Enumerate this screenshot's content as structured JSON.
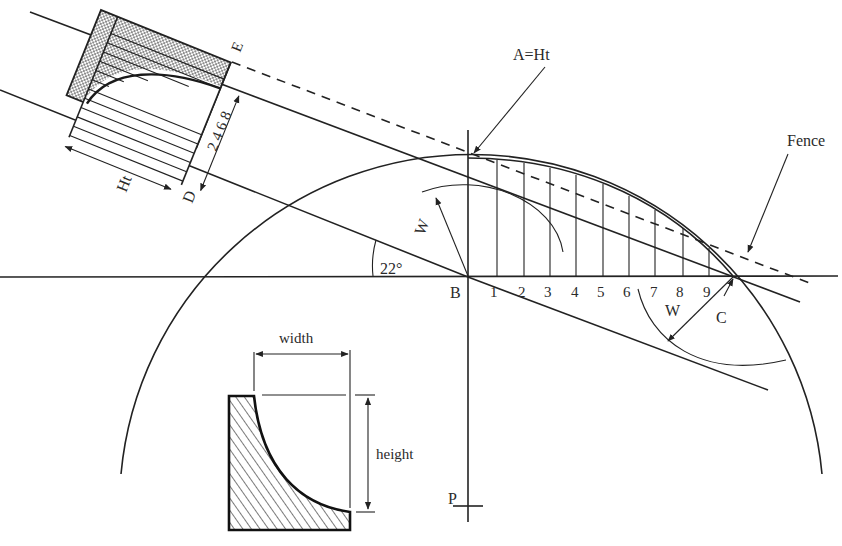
{
  "figure": {
    "angle_label": "22°",
    "labels": {
      "point_a": "A=Ht",
      "point_b": "B",
      "point_c": "C",
      "point_d": "D",
      "point_e": "E",
      "point_p": "P",
      "fence": "Fence",
      "ht": "Ht",
      "w_upper": "W",
      "w_lower": "W",
      "ordinate_scale": "2 4 6 8",
      "width": "width",
      "height": "height"
    },
    "baseline_ticks": [
      "1",
      "2",
      "3",
      "4",
      "5",
      "6",
      "7",
      "8",
      "9"
    ],
    "inset_profile": {
      "name": "cove moulding cross-section",
      "dimension_width": "width",
      "dimension_height": "height"
    },
    "colors": {
      "ink": "#222222",
      "background": "#ffffff",
      "shading": "#9a9a9a"
    }
  }
}
